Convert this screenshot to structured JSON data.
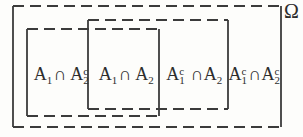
{
  "diagram": {
    "universe_label": "Ω",
    "colors": {
      "line": "#3b3b3b",
      "text": "#2d2d2d",
      "background": "#fdfdfb"
    },
    "regions": [
      {
        "id": "a1-intersect-a2-complement",
        "text": "A₁∩ A₂ᶜ",
        "parts": [
          {
            "t": "A",
            "sub": "1"
          },
          {
            "t": "∩ "
          },
          {
            "t": "A",
            "sub": "2",
            "sup": "c"
          }
        ]
      },
      {
        "id": "a1-intersect-a2",
        "text": "A₁∩ A₂",
        "parts": [
          {
            "t": "A",
            "sub": "1"
          },
          {
            "t": "∩ "
          },
          {
            "t": "A",
            "sub": "2"
          }
        ]
      },
      {
        "id": "a1-complement-intersect-a2",
        "text": "A₁ᶜ ∩A₂",
        "parts": [
          {
            "t": "A",
            "sub": "1",
            "sup": "c"
          },
          {
            "t": " ∩"
          },
          {
            "t": "A",
            "sub": "2"
          }
        ]
      },
      {
        "id": "a1-complement-intersect-a2-complement",
        "text": "A₁ᶜ∩A₂ᶜ",
        "parts": [
          {
            "t": "A",
            "sub": "1",
            "sup": "c"
          },
          {
            "t": "∩"
          },
          {
            "t": "A",
            "sub": "2",
            "sup": "c"
          }
        ]
      }
    ]
  }
}
